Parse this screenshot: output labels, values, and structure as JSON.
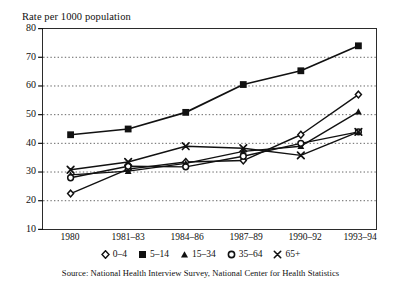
{
  "chart_data": {
    "type": "line",
    "title": "Rate per 1000 population",
    "ylabel": "Rate per 1000 population",
    "xlabel": "",
    "ylim": [
      10,
      80
    ],
    "yticks": [
      10,
      20,
      30,
      40,
      50,
      60,
      70,
      80
    ],
    "grid": "horizontal-dotted",
    "legend_position": "below-axis",
    "categories": [
      "1980",
      "1981–83",
      "1984–86",
      "1987–89",
      "1990–92",
      "1993–94"
    ],
    "series": [
      {
        "name": "0–4",
        "marker": "diamond-open",
        "values": [
          22.5,
          31.0,
          33.5,
          34.0,
          43.0,
          57.0
        ]
      },
      {
        "name": "5–14",
        "marker": "square-filled",
        "values": [
          43.0,
          45.0,
          50.8,
          60.5,
          65.3,
          74.0
        ]
      },
      {
        "name": "15–34",
        "marker": "triangle-filled",
        "values": [
          29.0,
          30.3,
          33.0,
          37.2,
          39.0,
          51.0
        ]
      },
      {
        "name": "35–64",
        "marker": "circle-open",
        "values": [
          28.0,
          32.0,
          31.8,
          35.5,
          40.0,
          44.0
        ]
      },
      {
        "name": "65+",
        "marker": "cross",
        "values": [
          30.8,
          33.5,
          39.0,
          38.3,
          35.8,
          44.0
        ]
      }
    ],
    "source": "Source: National Health Interview Survey, National Center for Health Statistics",
    "colors": {
      "ink": "#111111",
      "grid": "#555555",
      "frame": "#2b2b2b",
      "background": "#ffffff"
    }
  },
  "legend": {
    "entries": [
      {
        "label": "0–4",
        "icon": "diamond-open-marker-icon"
      },
      {
        "label": "5–14",
        "icon": "square-filled-marker-icon"
      },
      {
        "label": "15–34",
        "icon": "triangle-filled-marker-icon"
      },
      {
        "label": "35–64",
        "icon": "circle-open-marker-icon"
      },
      {
        "label": "65+",
        "icon": "cross-marker-icon"
      }
    ]
  }
}
